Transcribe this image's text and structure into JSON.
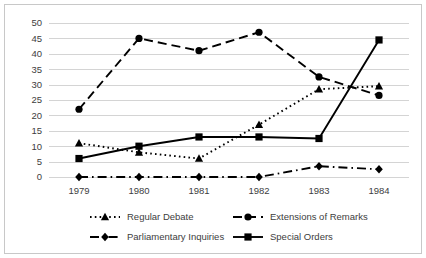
{
  "chart_data": {
    "type": "line",
    "title": "",
    "subtitle": "",
    "xlabel": "",
    "ylabel": "",
    "categories": [
      "1979",
      "1980",
      "1981",
      "1982",
      "1983",
      "1984"
    ],
    "x": [
      1979,
      1980,
      1981,
      1982,
      1983,
      1984
    ],
    "ylim": [
      0,
      50
    ],
    "yticks": [
      0,
      5,
      10,
      15,
      20,
      25,
      30,
      35,
      40,
      45,
      50
    ],
    "ytick_labels": [
      "0",
      "5",
      "10",
      "15",
      "20",
      "25",
      "30",
      "35",
      "40",
      "45",
      "50"
    ],
    "grid": "horizontal",
    "legend_position": "bottom",
    "series": [
      {
        "name": "Regular Debate",
        "values": [
          11,
          8,
          6,
          17,
          28.5,
          29.5
        ],
        "marker": "triangle",
        "linestyle": "dotted",
        "color": "#000000"
      },
      {
        "name": "Extensions of Remarks",
        "values": [
          22,
          45,
          41,
          47,
          32.5,
          26.5
        ],
        "marker": "circle",
        "linestyle": "dashed",
        "color": "#000000"
      },
      {
        "name": "Parliamentary Inquiries",
        "values": [
          0,
          0,
          0,
          0,
          3.5,
          2.5
        ],
        "marker": "diamond",
        "linestyle": "dashdot",
        "color": "#000000"
      },
      {
        "name": "Special Orders",
        "values": [
          6,
          10,
          13,
          13,
          12.5,
          44.5
        ],
        "marker": "square",
        "linestyle": "solid",
        "color": "#000000"
      }
    ]
  },
  "legend": {
    "entries": [
      {
        "label": "Regular Debate"
      },
      {
        "label": "Extensions of Remarks"
      },
      {
        "label": "Parliamentary Inquiries"
      },
      {
        "label": "Special Orders"
      }
    ]
  },
  "axes": {
    "y_tick_labels": [
      "50",
      "45",
      "40",
      "35",
      "30",
      "25",
      "20",
      "15",
      "10",
      "5",
      "0"
    ],
    "x_tick_labels": [
      "1979",
      "1980",
      "1981",
      "1982",
      "1983",
      "1984"
    ]
  },
  "colors": {
    "ink": "#000000",
    "grid": "#d4d4d4",
    "border": "#c8c8c8",
    "text": "#3d3d3d",
    "background": "#ffffff"
  }
}
